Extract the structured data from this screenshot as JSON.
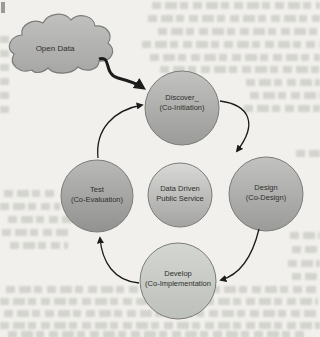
{
  "figure": {
    "cloud": {
      "label": "Open Data"
    },
    "nodes": {
      "discover": {
        "line1": "Discover_",
        "line2": "(Co-Initiation)"
      },
      "design": {
        "line1": "Design",
        "line2": "(Co-Design)"
      },
      "develop": {
        "line1": "Develop",
        "line2": "(Co-Implementation"
      },
      "test": {
        "line1": "Test",
        "line2": "(Co-Evaluation)"
      },
      "center": {
        "line1": "Data Driven",
        "line2": "Public Service"
      }
    },
    "colors": {
      "background": "#f1f0ec",
      "node_top": "#c2c2c0",
      "node_bottom": "#9b9b99",
      "test_top": "#b9b9b7",
      "test_bottom": "#929290",
      "develop_top": "#d4d6d2",
      "develop_bottom": "#bdc0bb",
      "center_top": "#d9d9d7",
      "center_bottom": "#a3a3a1",
      "cloud_top": "#c0c0be",
      "cloud_bottom": "#a7a7a5",
      "node_border": "#7b7b79",
      "arrow": "#1c1c1c",
      "label_text": "#2f2f2d"
    }
  }
}
